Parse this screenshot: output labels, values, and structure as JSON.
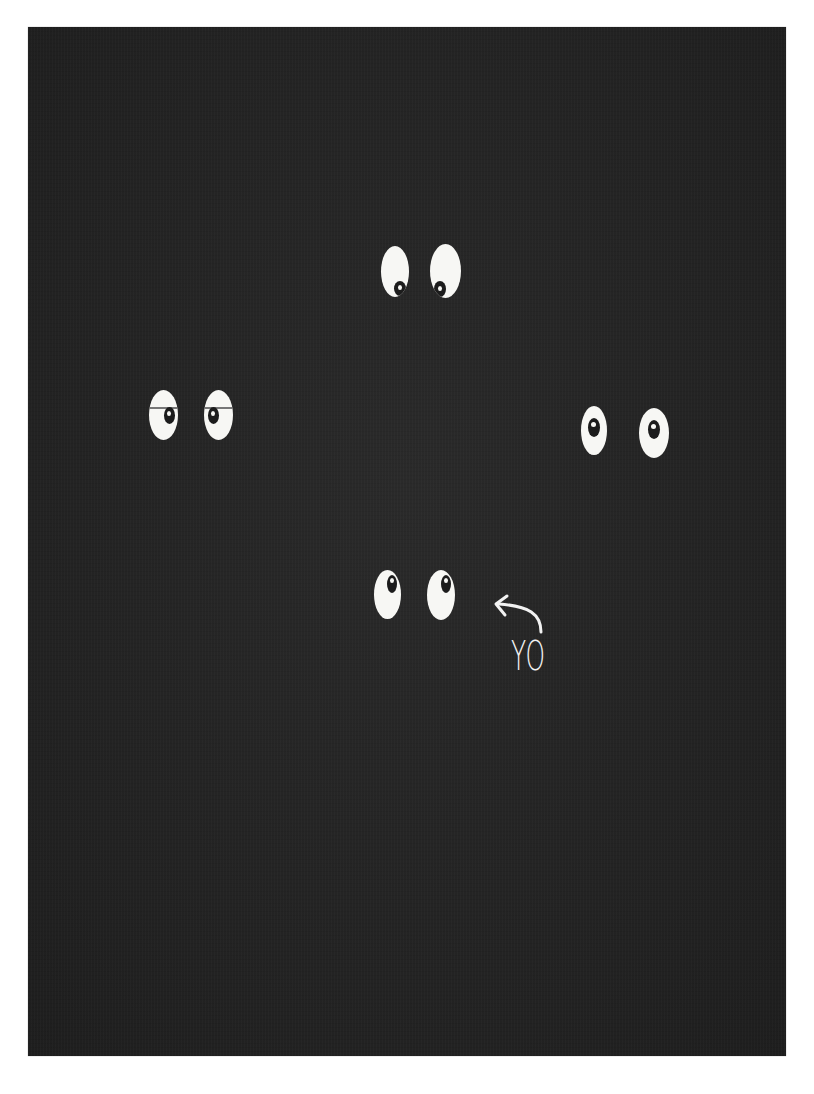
{
  "card": {
    "background_color": "#242424",
    "border_color": "#ffffff",
    "eye_color": "#f7f7f4",
    "pupil_color": "#1c1c1c"
  },
  "eye_pairs": [
    {
      "position": "top-center",
      "gaze": "down"
    },
    {
      "position": "middle-left",
      "gaze": "sideways-sleepy"
    },
    {
      "position": "middle-right",
      "gaze": "forward"
    },
    {
      "position": "bottom-center",
      "gaze": "up-right"
    }
  ],
  "annotation": {
    "text": "YO",
    "icon": "curved-arrow-icon"
  }
}
